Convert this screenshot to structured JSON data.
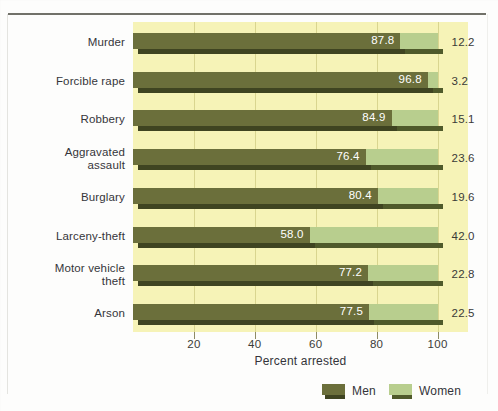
{
  "chart_data": {
    "type": "bar",
    "orientation": "horizontal",
    "stacked": true,
    "title": "",
    "xlabel": "Percent arrested",
    "ylabel": "",
    "xlim": [
      0,
      110
    ],
    "xticks": [
      20,
      40,
      60,
      80,
      100
    ],
    "xticklabels": [
      "20",
      "40",
      "60",
      "80",
      "100"
    ],
    "grid": "vertical",
    "legend_position": "bottom",
    "categories": [
      "Murder",
      "Forcible rape",
      "Robbery",
      "Aggravated\nassault",
      "Burglary",
      "Larceny-theft",
      "Motor vehicle\ntheft",
      "Arson"
    ],
    "series": [
      {
        "name": "Men",
        "color": "#6b6f3b",
        "values": [
          87.8,
          96.8,
          84.9,
          76.4,
          80.4,
          58.0,
          77.2,
          77.5
        ],
        "labels": [
          "87.8",
          "96.8",
          "84.9",
          "76.4",
          "80.4",
          "58.0",
          "77.2",
          "77.5"
        ]
      },
      {
        "name": "Women",
        "color": "#b8ce8e",
        "values": [
          12.2,
          3.2,
          15.1,
          23.6,
          19.6,
          42.0,
          22.8,
          22.5
        ],
        "labels": [
          "12.2",
          "3.2",
          "15.1",
          "23.6",
          "19.6",
          "42.0",
          "22.8",
          "22.5"
        ]
      }
    ]
  },
  "colors": {
    "plot_background": "#f6f3b7",
    "gridline": "#d9d58f",
    "men": "#6b6f3b",
    "men_shadow": "#3f4421",
    "women": "#b8ce8e",
    "women_shadow": "#4f5a2b",
    "text": "#34343a",
    "value_text_on_bar": "#ffffff"
  },
  "legend": {
    "items": [
      {
        "label": "Men",
        "swatch": "men-swatch"
      },
      {
        "label": "Women",
        "swatch": "women-swatch"
      }
    ]
  }
}
